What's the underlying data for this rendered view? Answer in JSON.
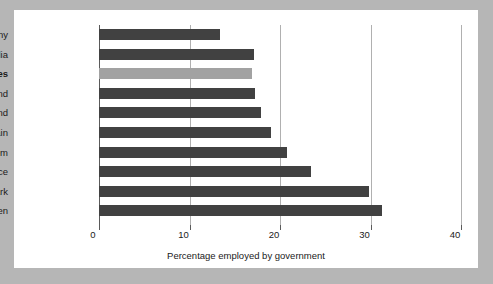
{
  "chart_data": {
    "type": "bar",
    "orientation": "horizontal",
    "title": "",
    "xlabel": "Percentage employed by government",
    "ylabel": "",
    "xlim": [
      0,
      40
    ],
    "xticks": [
      0,
      10,
      20,
      30,
      40
    ],
    "xtick_labels": [
      "0",
      "10",
      "20",
      "30",
      "40"
    ],
    "grid": true,
    "legend": "none",
    "highlight_category": "United States",
    "colors": {
      "bar": "#414141",
      "bar_highlight": "#a2a2a2",
      "gridline": "#b0b0b0",
      "axis": "#5a5a5a",
      "panel_background": "#ffffff",
      "page_background": "#b6b6b6",
      "text": "#1a1a1a"
    },
    "categories": [
      "Germany",
      "Australia",
      "United States",
      "Switzerland",
      "New Zealand",
      "Spain",
      "United Kingdom",
      "France",
      "Denmark",
      "Sweden"
    ],
    "values": [
      13.4,
      17.1,
      16.9,
      17.2,
      17.9,
      19.0,
      20.8,
      23.4,
      29.8,
      31.3
    ],
    "bars": [
      {
        "label": "Germany",
        "value": 13.4,
        "highlight": false
      },
      {
        "label": "Australia",
        "value": 17.1,
        "highlight": false
      },
      {
        "label": "United States",
        "value": 16.9,
        "highlight": true
      },
      {
        "label": "Switzerland",
        "value": 17.2,
        "highlight": false
      },
      {
        "label": "New Zealand",
        "value": 17.9,
        "highlight": false
      },
      {
        "label": "Spain",
        "value": 19.0,
        "highlight": false
      },
      {
        "label": "United Kingdom",
        "value": 20.8,
        "highlight": false
      },
      {
        "label": "France",
        "value": 23.4,
        "highlight": false
      },
      {
        "label": "Denmark",
        "value": 29.8,
        "highlight": false
      },
      {
        "label": "Sweden",
        "value": 31.3,
        "highlight": false
      }
    ]
  }
}
